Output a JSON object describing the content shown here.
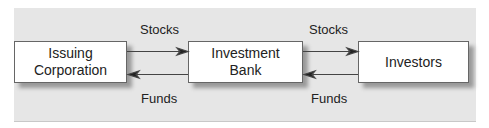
{
  "nodes": [
    {
      "id": "issuer",
      "label_line1": "Issuing",
      "label_line2": "Corporation"
    },
    {
      "id": "bank",
      "label_line1": "Investment",
      "label_line2": "Bank"
    },
    {
      "id": "investors",
      "label": "Investors"
    }
  ],
  "edges": {
    "top_left": "Stocks",
    "bottom_left": "Funds",
    "top_right": "Stocks",
    "bottom_right": "Funds"
  }
}
